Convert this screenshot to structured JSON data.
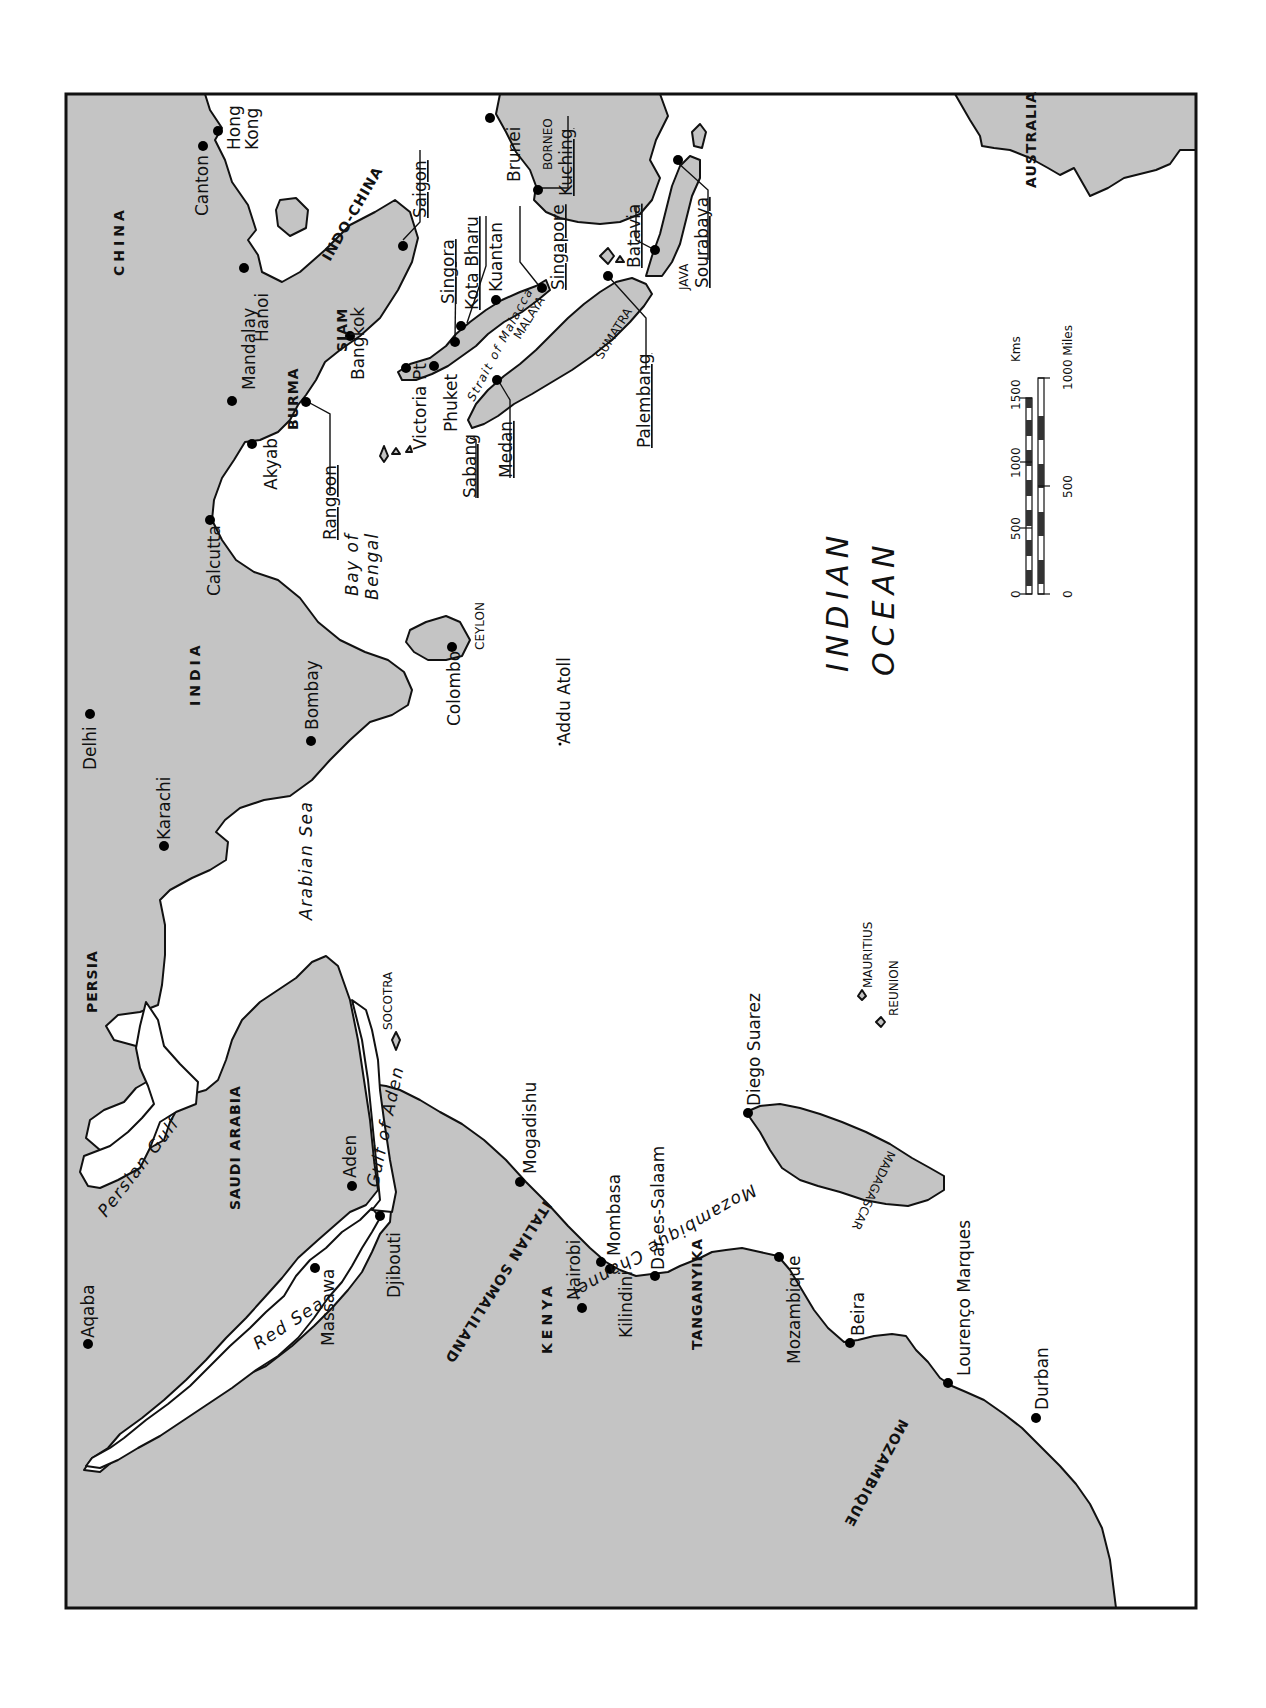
{
  "map": {
    "orientation": "rotated 90 degrees clockwise (north points left)",
    "colors": {
      "land": "#c4c4c4",
      "water": "#ffffff",
      "outline": "#111111"
    },
    "countries": [
      {
        "label": "CHINA"
      },
      {
        "label": "INDO-CHINA"
      },
      {
        "label": "SIAM"
      },
      {
        "label": "BURMA"
      },
      {
        "label": "INDIA"
      },
      {
        "label": "PERSIA"
      },
      {
        "label": "SAUDI ARABIA"
      },
      {
        "label": "ITALIAN SOMALILAND"
      },
      {
        "label": "KENYA"
      },
      {
        "label": "TANGANYIKA"
      },
      {
        "label": "MOZAMBIQUE"
      },
      {
        "label": "AUSTRALIA"
      }
    ],
    "regions": [
      {
        "label": "BORNEO"
      },
      {
        "label": "MALAYA"
      },
      {
        "label": "SUMATRA"
      },
      {
        "label": "JAVA"
      },
      {
        "label": "CEYLON"
      },
      {
        "label": "SOCOTRA"
      },
      {
        "label": "MADAGASCAR"
      },
      {
        "label": "MAURITIUS"
      },
      {
        "label": "REUNION"
      }
    ],
    "water_bodies": [
      {
        "label": "Bay of"
      },
      {
        "label": "Bengal"
      },
      {
        "label": "Arabian Sea"
      },
      {
        "label": "Persian Gulf"
      },
      {
        "label": "Red Sea"
      },
      {
        "label": "Gulf of Aden"
      },
      {
        "label": "Strait of Malacca"
      },
      {
        "label": "Mozambique Channel"
      },
      {
        "label": "INDIAN"
      },
      {
        "label": "OCEAN"
      }
    ],
    "cities": [
      {
        "label": "Hong"
      },
      {
        "label": "Kong"
      },
      {
        "label": "Canton"
      },
      {
        "label": "Hanoi"
      },
      {
        "label": "Mandalay"
      },
      {
        "label": "Saigon"
      },
      {
        "label": "Bangkok"
      },
      {
        "label": "Akyab"
      },
      {
        "label": "Rangoon"
      },
      {
        "label": "Calcutta"
      },
      {
        "label": "Victoria Pt"
      },
      {
        "label": "Phuket"
      },
      {
        "label": "Singora"
      },
      {
        "label": "Kota Bharu"
      },
      {
        "label": "Kuantan"
      },
      {
        "label": "Singapore"
      },
      {
        "label": "Brunei"
      },
      {
        "label": "Kuching"
      },
      {
        "label": "Batavia"
      },
      {
        "label": "Sourabaya"
      },
      {
        "label": "Palembang"
      },
      {
        "label": "Medan"
      },
      {
        "label": "Sabang"
      },
      {
        "label": "Colombo"
      },
      {
        "label": "Addu Atoll"
      },
      {
        "label": "Delhi"
      },
      {
        "label": "Bombay"
      },
      {
        "label": "Karachi"
      },
      {
        "label": "Aqaba"
      },
      {
        "label": "Massawa"
      },
      {
        "label": "Aden"
      },
      {
        "label": "Djibouti"
      },
      {
        "label": "Mogadishu"
      },
      {
        "label": "Nairobi"
      },
      {
        "label": "Mombasa"
      },
      {
        "label": "Kilindini"
      },
      {
        "label": "Dar-es-Salaam"
      },
      {
        "label": "Mozambique"
      },
      {
        "label": "Beira"
      },
      {
        "label": "Lourenço Marques"
      },
      {
        "label": "Durban"
      },
      {
        "label": "Diego Suarez"
      }
    ],
    "scale_bar": {
      "kms_label": "Kms",
      "kms_ticks": [
        "0",
        "500",
        "1000",
        "1500"
      ],
      "miles_label": "1000 Miles",
      "miles_ticks": [
        "0",
        "500"
      ]
    }
  }
}
